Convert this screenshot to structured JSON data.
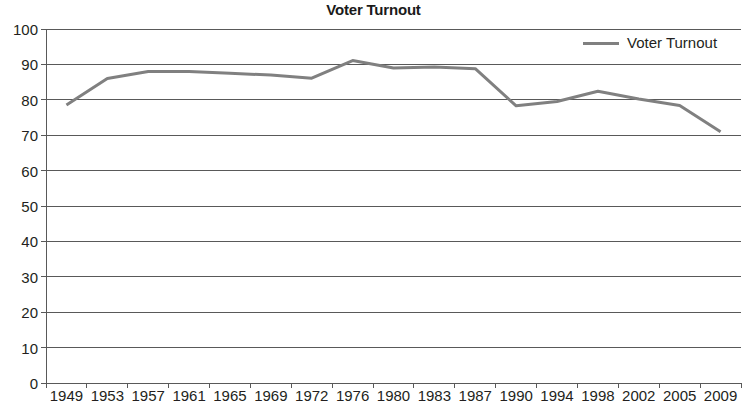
{
  "chart_data": {
    "type": "line",
    "title": "Voter Turnout",
    "xlabel": "",
    "ylabel": "",
    "ylim": [
      0,
      100
    ],
    "y_ticks": [
      0,
      10,
      20,
      30,
      40,
      50,
      60,
      70,
      80,
      90,
      100
    ],
    "grid": "horizontal",
    "legend_position": "top-right",
    "categories": [
      "1949",
      "1953",
      "1957",
      "1961",
      "1965",
      "1969",
      "1972",
      "1976",
      "1980",
      "1983",
      "1987",
      "1990",
      "1994",
      "1998",
      "2002",
      "2005",
      "2009"
    ],
    "series": [
      {
        "name": "Voter Turnout",
        "color": "#808080",
        "values": [
          78.5,
          86.0,
          88.0,
          88.0,
          87.5,
          87.0,
          86.1,
          91.1,
          89.0,
          89.3,
          88.8,
          78.3,
          79.5,
          82.4,
          80.2,
          78.4,
          71.0
        ]
      }
    ]
  },
  "legend": {
    "entries": [
      {
        "label": "Voter Turnout",
        "color": "#808080"
      }
    ]
  },
  "axis": {
    "y_labels": [
      "100",
      "90",
      "80",
      "70",
      "60",
      "50",
      "40",
      "30",
      "20",
      "10",
      "0"
    ],
    "x_labels": [
      "1949",
      "1953",
      "1957",
      "1961",
      "1965",
      "1969",
      "1972",
      "1976",
      "1980",
      "1983",
      "1987",
      "1990",
      "1994",
      "1998",
      "2002",
      "2005",
      "2009"
    ]
  },
  "colors": {
    "series_line": "#808080",
    "gridline": "#595959",
    "axis_line": "#595959",
    "text": "#231f20"
  }
}
